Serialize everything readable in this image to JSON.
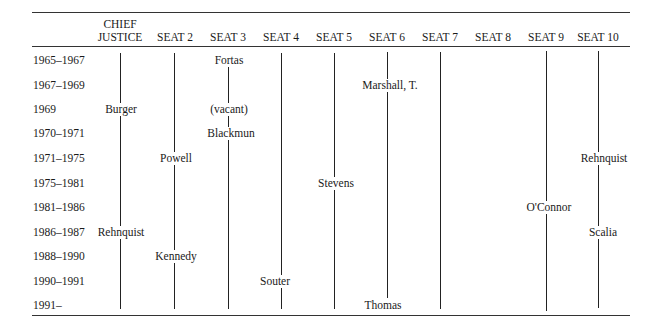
{
  "table": {
    "headers": [
      "CHIEF JUSTICE",
      "SEAT 2",
      "SEAT 3",
      "SEAT 4",
      "SEAT 5",
      "SEAT 6",
      "SEAT 7",
      "SEAT 8",
      "SEAT 9",
      "SEAT 10"
    ],
    "header_lines": {
      "chief_1": "CHIEF",
      "chief_2": "JUSTICE"
    },
    "rows": [
      "1965–1967",
      "1967–1969",
      "1969",
      "1970–1971",
      "1971–1975",
      "1975–1981",
      "1981–1986",
      "1986–1987",
      "1988–1990",
      "1990–1991",
      "1991–"
    ],
    "entries": [
      {
        "seat": "SEAT 3",
        "row": "1965–1967",
        "name": "Fortas"
      },
      {
        "seat": "SEAT 6",
        "row": "1967–1969",
        "name": "Marshall, T."
      },
      {
        "seat": "CHIEF JUSTICE",
        "row": "1969",
        "name": "Burger"
      },
      {
        "seat": "SEAT 3",
        "row": "1969",
        "name": "(vacant)"
      },
      {
        "seat": "SEAT 3",
        "row": "1970–1971",
        "name": "Blackmun"
      },
      {
        "seat": "SEAT 2",
        "row": "1971–1975",
        "name": "Powell"
      },
      {
        "seat": "SEAT 10",
        "row": "1971–1975",
        "name": "Rehnquist"
      },
      {
        "seat": "SEAT 5",
        "row": "1975–1981",
        "name": "Stevens"
      },
      {
        "seat": "SEAT 9",
        "row": "1981–1986",
        "name": "O'Connor"
      },
      {
        "seat": "CHIEF JUSTICE",
        "row": "1986–1987",
        "name": "Rehnquist"
      },
      {
        "seat": "SEAT 10",
        "row": "1986–1987",
        "name": "Scalia"
      },
      {
        "seat": "SEAT 2",
        "row": "1988–1990",
        "name": "Kennedy"
      },
      {
        "seat": "SEAT 4",
        "row": "1990–1991",
        "name": "Souter"
      },
      {
        "seat": "SEAT 6",
        "row": "1991–",
        "name": "Thomas"
      }
    ]
  }
}
